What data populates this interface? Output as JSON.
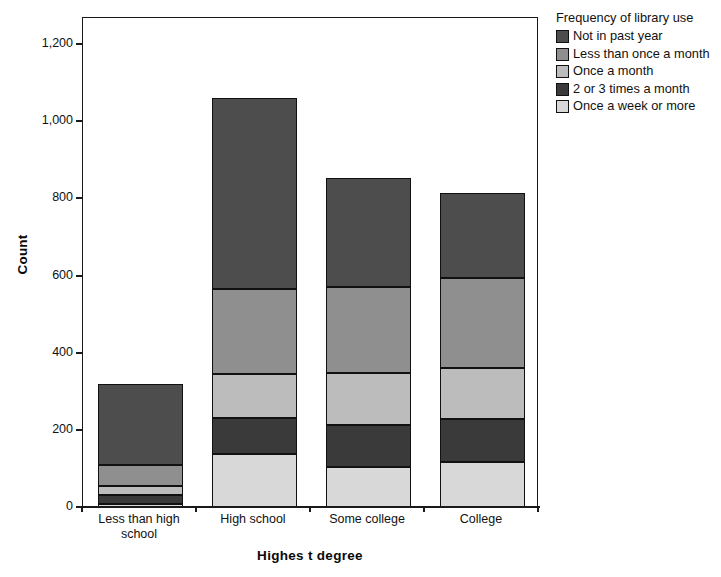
{
  "chart_data": {
    "type": "bar",
    "subtype": "stacked-bar",
    "title": "",
    "xlabel": "Highes t degree",
    "ylabel": "Count",
    "categories": [
      "Less than high school",
      "High school",
      "Some college",
      "College"
    ],
    "ylim": [
      0,
      1200
    ],
    "yticks": [
      0,
      200,
      400,
      600,
      800,
      1000,
      1200
    ],
    "ytick_labels": [
      "0",
      "200",
      "400",
      "600",
      "800",
      "1,000",
      "1,200"
    ],
    "grid": false,
    "legend_position": "right",
    "legend_title": "Frequency of library use",
    "series": [
      {
        "name": "Once a week or more",
        "color": "#d8d8d8",
        "values": [
          8,
          137,
          104,
          117
        ]
      },
      {
        "name": "2 or 3 times a month",
        "color": "#3a3a3a",
        "values": [
          23,
          93,
          109,
          111
        ]
      },
      {
        "name": "Once a month",
        "color": "#bcbcbc",
        "values": [
          23,
          114,
          135,
          132
        ]
      },
      {
        "name": "Less than once a month",
        "color": "#8f8f8f",
        "values": [
          54,
          220,
          223,
          233
        ]
      },
      {
        "name": "Not in past year",
        "color": "#4d4d4d",
        "values": [
          212,
          497,
          282,
          220
        ]
      }
    ],
    "stack_order_bottom_to_top": [
      "Once a week or more",
      "2 or 3 times a month",
      "Once a month",
      "Less than once a month",
      "Not in past year"
    ],
    "totals": [
      320,
      1061,
      853,
      813
    ]
  },
  "axes": {
    "y_title": "Count",
    "x_title": "Highes t degree",
    "y_tick_labels": [
      "1,200",
      "1,000",
      "800",
      "600",
      "400",
      "200",
      "0"
    ],
    "x_tick_labels": [
      "Less than high school",
      "High school",
      "Some college",
      "College"
    ]
  },
  "legend": {
    "title": "Frequency of library use",
    "items": [
      {
        "label": "Not in past year",
        "color": "#4d4d4d"
      },
      {
        "label": "Less than once a month",
        "color": "#8f8f8f"
      },
      {
        "label": "Once a month",
        "color": "#bcbcbc"
      },
      {
        "label": "2 or 3 times a month",
        "color": "#3a3a3a"
      },
      {
        "label": "Once a week or more",
        "color": "#d8d8d8"
      }
    ]
  }
}
